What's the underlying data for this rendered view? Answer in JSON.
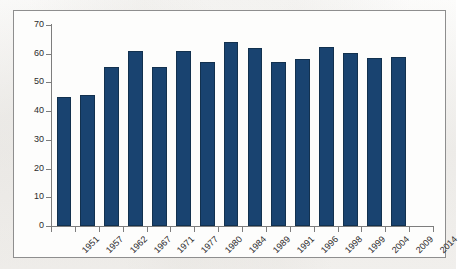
{
  "chart_data": {
    "type": "bar",
    "title": "",
    "subtitle": "",
    "xlabel": "",
    "ylabel": "",
    "categories": [
      "1951",
      "1957",
      "1962",
      "1967",
      "1971",
      "1977",
      "1980",
      "1984",
      "1989",
      "1991",
      "1996",
      "1998",
      "1999",
      "2004",
      "2009",
      "2014"
    ],
    "values": [
      45,
      45.5,
      55.5,
      61,
      55.5,
      60.8,
      57,
      64,
      62,
      57,
      58.2,
      62.3,
      60.3,
      58.5,
      58.7,
      null
    ],
    "ylim": [
      0,
      70
    ],
    "yticks": [
      0,
      10,
      20,
      30,
      40,
      50,
      60,
      70
    ],
    "ytick_labels": [
      "0",
      "10",
      "20",
      "30",
      "40",
      "50",
      "60",
      "70"
    ],
    "grid": false,
    "legend": null,
    "series": [
      {
        "name": "",
        "color": "#194370",
        "values": [
          45,
          45.5,
          55.5,
          61,
          55.5,
          60.8,
          57,
          64,
          62,
          57,
          58.2,
          62.3,
          60.3,
          58.5,
          58.7,
          null
        ]
      }
    ]
  },
  "colors": {
    "bar_fill": "#194370",
    "bar_stroke": "#12314f",
    "axis": "#7d7d7d",
    "frame": "#8e8e8e",
    "text": "#2c2c2c",
    "plot_background": "#fdfdfc",
    "page_background": "#f8f7f5"
  }
}
